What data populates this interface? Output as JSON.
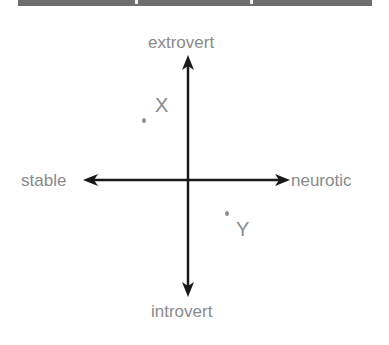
{
  "banner": {
    "color": "#6e6e6e"
  },
  "diagram": {
    "axis_color": "#1a1a1a",
    "label_color": "#8a8a8a",
    "axes": {
      "top": "extrovert",
      "bottom": "introvert",
      "left": "stable",
      "right": "neurotic"
    },
    "points": [
      {
        "label": "X",
        "quadrant": "stable-extrovert"
      },
      {
        "label": "Y",
        "quadrant": "neurotic-introvert"
      }
    ]
  }
}
